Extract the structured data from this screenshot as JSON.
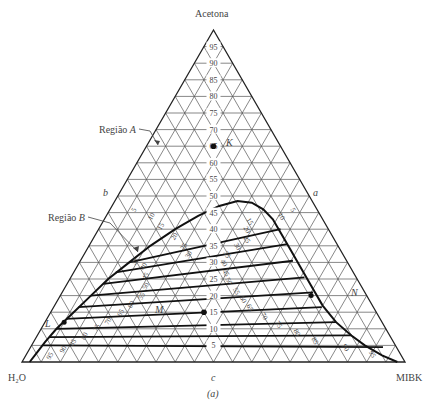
{
  "diagram": {
    "title_vertex_top": "Acetona",
    "vertex_left": "H₂O",
    "vertex_right": "MIBK",
    "side_label_left": "b",
    "side_label_right": "a",
    "side_label_bottom": "c",
    "caption": "(a)",
    "region_a_label": "Região",
    "region_a_letter": "A",
    "region_b_label": "Região",
    "region_b_letter": "B",
    "point_k": "K",
    "point_m": "M",
    "point_l": "L",
    "point_n": "N",
    "grid_step_percent": 5,
    "acetone_scale": [
      5,
      10,
      15,
      20,
      25,
      30,
      35,
      40,
      45,
      50,
      55,
      60,
      65,
      70,
      75,
      80,
      85,
      90,
      95
    ],
    "colors": {
      "grid": "#555555",
      "frame": "#222222",
      "curve": "#111111",
      "text": "#444444"
    },
    "point_k_composition": {
      "acetone": 65,
      "mibk": 0
    },
    "binodal_curve": [
      [
        0.0,
        0.02
      ],
      [
        0.03,
        0.025
      ],
      [
        0.06,
        0.03
      ],
      [
        0.1,
        0.04
      ],
      [
        0.15,
        0.06
      ],
      [
        0.2,
        0.08
      ],
      [
        0.25,
        0.1
      ],
      [
        0.3,
        0.13
      ],
      [
        0.35,
        0.16
      ],
      [
        0.4,
        0.2
      ],
      [
        0.44,
        0.24
      ],
      [
        0.47,
        0.28
      ],
      [
        0.485,
        0.32
      ],
      [
        0.48,
        0.36
      ],
      [
        0.46,
        0.4
      ],
      [
        0.43,
        0.44
      ],
      [
        0.39,
        0.48
      ],
      [
        0.34,
        0.53
      ],
      [
        0.29,
        0.58
      ],
      [
        0.23,
        0.64
      ],
      [
        0.17,
        0.7
      ],
      [
        0.12,
        0.76
      ],
      [
        0.08,
        0.82
      ],
      [
        0.05,
        0.87
      ],
      [
        0.02,
        0.93
      ],
      [
        0.0,
        0.98
      ]
    ],
    "tie_lines": [
      {
        "left": [
          0.05,
          0.03
        ],
        "right": [
          0.045,
          0.92
        ]
      },
      {
        "left": [
          0.075,
          0.035
        ],
        "right": [
          0.08,
          0.82
        ]
      },
      {
        "left": [
          0.1,
          0.04
        ],
        "right": [
          0.12,
          0.76
        ]
      },
      {
        "left": [
          0.13,
          0.05
        ],
        "right": [
          0.165,
          0.7
        ]
      },
      {
        "left": [
          0.165,
          0.065
        ],
        "right": [
          0.21,
          0.655
        ]
      },
      {
        "left": [
          0.2,
          0.08
        ],
        "right": [
          0.255,
          0.61
        ]
      },
      {
        "left": [
          0.235,
          0.095
        ],
        "right": [
          0.305,
          0.555
        ]
      },
      {
        "left": [
          0.27,
          0.11
        ],
        "right": [
          0.355,
          0.515
        ]
      },
      {
        "left": [
          0.3,
          0.13
        ],
        "right": [
          0.4,
          0.475
        ]
      }
    ],
    "left_branch_labels": [
      {
        "text": "5",
        "a": 0.455,
        "m": 0.07
      },
      {
        "text": "10",
        "a": 0.435,
        "m": 0.125
      },
      {
        "text": "15",
        "a": 0.405,
        "m": 0.165
      },
      {
        "text": "20",
        "a": 0.375,
        "m": 0.215
      },
      {
        "text": "25",
        "a": 0.345,
        "m": 0.255
      },
      {
        "text": "30",
        "a": 0.32,
        "m": 0.28
      },
      {
        "text": "35",
        "a": 0.3,
        "m": 0.15
      },
      {
        "text": "40",
        "a": 0.285,
        "m": 0.18
      },
      {
        "text": "45",
        "a": 0.255,
        "m": 0.2
      },
      {
        "text": "50",
        "a": 0.225,
        "m": 0.215
      },
      {
        "text": "55",
        "a": 0.195,
        "m": 0.22
      },
      {
        "text": "60",
        "a": 0.17,
        "m": 0.205
      },
      {
        "text": "65",
        "a": 0.145,
        "m": 0.19
      },
      {
        "text": "70",
        "a": 0.12,
        "m": 0.17
      },
      {
        "text": "75",
        "a": 0.1,
        "m": 0.15
      },
      {
        "text": "80",
        "a": 0.075,
        "m": 0.13
      },
      {
        "text": "85",
        "a": 0.055,
        "m": 0.11
      },
      {
        "text": "90",
        "a": 0.035,
        "m": 0.095
      },
      {
        "text": "95",
        "a": 0.015,
        "m": 0.07
      }
    ],
    "right_branch_labels": [
      {
        "text": "5",
        "a": 0.455,
        "m": 0.475
      },
      {
        "text": "10",
        "a": 0.435,
        "m": 0.455
      },
      {
        "text": "15",
        "a": 0.42,
        "m": 0.38
      },
      {
        "text": "20",
        "a": 0.395,
        "m": 0.385
      },
      {
        "text": "25",
        "a": 0.365,
        "m": 0.4
      },
      {
        "text": "30",
        "a": 0.345,
        "m": 0.385
      },
      {
        "text": "35",
        "a": 0.32,
        "m": 0.37
      },
      {
        "text": "40",
        "a": 0.295,
        "m": 0.375
      },
      {
        "text": "45",
        "a": 0.265,
        "m": 0.395
      },
      {
        "text": "50",
        "a": 0.24,
        "m": 0.415
      },
      {
        "text": "55",
        "a": 0.21,
        "m": 0.45
      },
      {
        "text": "60",
        "a": 0.185,
        "m": 0.48
      },
      {
        "text": "65",
        "a": 0.16,
        "m": 0.51
      },
      {
        "text": "70",
        "a": 0.135,
        "m": 0.56
      },
      {
        "text": "75",
        "a": 0.11,
        "m": 0.61
      },
      {
        "text": "80",
        "a": 0.085,
        "m": 0.67
      },
      {
        "text": "85",
        "a": 0.06,
        "m": 0.73
      },
      {
        "text": "90",
        "a": 0.04,
        "m": 0.82
      },
      {
        "text": "95",
        "a": 0.02,
        "m": 0.9
      }
    ]
  }
}
